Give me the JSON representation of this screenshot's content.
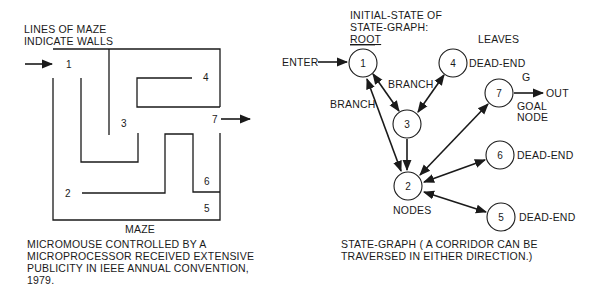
{
  "maze": {
    "title_lines": [
      "LINES OF MAZE",
      "INDICATE WALLS"
    ],
    "caption": "MAZE",
    "cell_labels": [
      {
        "id": "1",
        "x": 66,
        "y": 68
      },
      {
        "id": "2",
        "x": 65,
        "y": 197
      },
      {
        "id": "3",
        "x": 121,
        "y": 127
      },
      {
        "id": "4",
        "x": 203,
        "y": 81
      },
      {
        "id": "5",
        "x": 204,
        "y": 212
      },
      {
        "id": "6",
        "x": 204,
        "y": 185
      },
      {
        "id": "7",
        "x": 213,
        "y": 123
      }
    ],
    "description_lines": [
      "MICROMOUSE CONTROLLED BY A",
      "MICROPROCESSOR RECEIVED EXTENSIVE",
      "PUBLICITY IN IEEE ANNUAL CONVENTION,",
      "1979."
    ]
  },
  "graph": {
    "root_label_lines": [
      "INITIAL-STATE OF",
      "STATE-GRAPH:",
      "ROOT"
    ],
    "leaves_label": "LEAVES",
    "enter_label": "ENTER",
    "out_label": "OUT",
    "goal_letter": "G",
    "goal_label_lines": [
      "GOAL",
      "NODE"
    ],
    "branch_label_1": "BRANCH",
    "branch_label_2": "BRANCH",
    "nodes_label": "NODES",
    "dead_end_label": "DEAD-END",
    "nodes": [
      {
        "id": "1",
        "cx": 363,
        "cy": 63
      },
      {
        "id": "2",
        "cx": 408,
        "cy": 186
      },
      {
        "id": "3",
        "cx": 407,
        "cy": 124
      },
      {
        "id": "4",
        "cx": 453,
        "cy": 63
      },
      {
        "id": "5",
        "cx": 501,
        "cy": 217
      },
      {
        "id": "6",
        "cx": 500,
        "cy": 155
      },
      {
        "id": "7",
        "cx": 499,
        "cy": 93
      }
    ],
    "edges": [
      {
        "from": "1",
        "to": "3",
        "direction": "both"
      },
      {
        "from": "4",
        "to": "3",
        "direction": "both"
      },
      {
        "from": "1",
        "to": "2",
        "direction": "both"
      },
      {
        "from": "3",
        "to": "2",
        "direction": "to"
      },
      {
        "from": "2",
        "to": "7",
        "direction": "both"
      },
      {
        "from": "2",
        "to": "6",
        "direction": "both"
      },
      {
        "from": "2",
        "to": "5",
        "direction": "both"
      }
    ],
    "caption_lines": [
      "STATE-GRAPH ( A CORRIDOR CAN BE",
      "TRAVERSED IN EITHER DIRECTION.)"
    ]
  }
}
